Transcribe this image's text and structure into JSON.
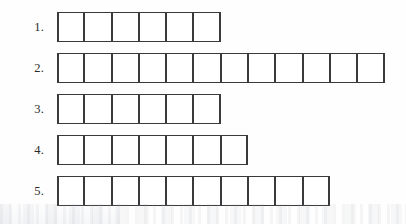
{
  "worksheet": {
    "title": "Numbered box-strip worksheet",
    "background_color": "#ffffff",
    "box_border_color": "#3a3a3c",
    "label_color": "#2a2a2a",
    "rows": [
      {
        "label": "1.",
        "box_count": 6
      },
      {
        "label": "2.",
        "box_count": 12
      },
      {
        "label": "3.",
        "box_count": 6
      },
      {
        "label": "4.",
        "box_count": 7
      },
      {
        "label": "5.",
        "box_count": 10
      }
    ]
  }
}
